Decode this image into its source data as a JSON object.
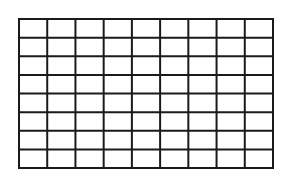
{
  "diagram": {
    "type": "grid",
    "columns": 9,
    "rows": 8,
    "line_color": "#1a1a1a",
    "background_color": "#ffffff",
    "line_width": 2
  }
}
